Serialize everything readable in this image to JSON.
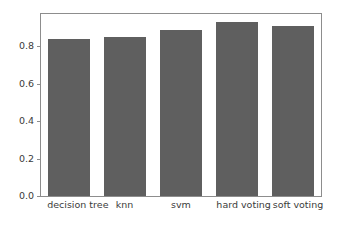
{
  "chart_data": {
    "type": "bar",
    "title": "",
    "xlabel": "",
    "ylabel": "",
    "categories": [
      "decision tree",
      "knn",
      "svm",
      "hard voting",
      "soft voting"
    ],
    "values": [
      0.84,
      0.85,
      0.89,
      0.93,
      0.91
    ],
    "ylim": [
      0.0,
      0.9735
    ],
    "yticks": [
      0.0,
      0.2,
      0.4,
      0.6,
      0.8
    ],
    "ytick_labels": [
      "0.0",
      "0.2",
      "0.4",
      "0.6",
      "0.8"
    ],
    "grid": false,
    "legend": null,
    "bar_color": "#5f5f5f",
    "background_color": "#ffffff",
    "axes_edge_color": "#8d8d8d"
  }
}
